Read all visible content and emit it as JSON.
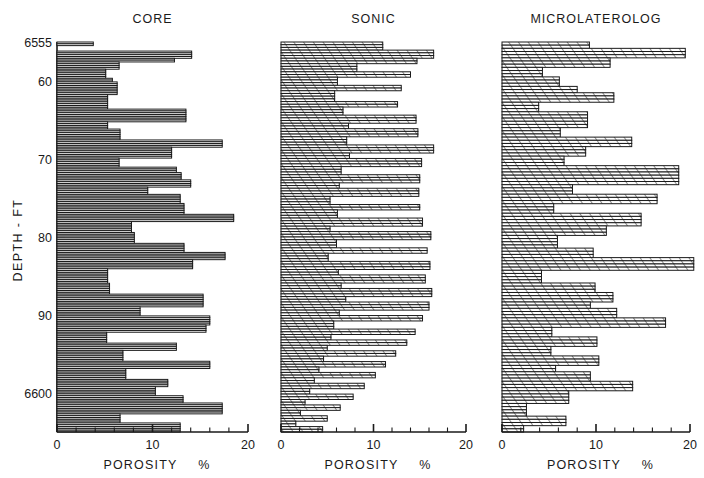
{
  "figure": {
    "ylabel": "DEPTH  -  FT",
    "xlabel": "POROSITY",
    "xunit": "%",
    "panels": [
      "CORE",
      "SONIC",
      "MICROLATEROLOG"
    ]
  },
  "chart_data": {
    "type": "bar",
    "orientation": "horizontal",
    "title": "",
    "xlabel": "POROSITY  %",
    "ylabel": "DEPTH - FT",
    "xlim": [
      0,
      20
    ],
    "ylim": [
      6555,
      6605
    ],
    "xticks": [
      0,
      10,
      20
    ],
    "xtick_labels": [
      "0",
      "10",
      "20"
    ],
    "xminor_step": 2,
    "yticks": [
      6555,
      6560,
      6570,
      6580,
      6590,
      6600
    ],
    "ytick_labels": [
      "6555",
      "60",
      "70",
      "80",
      "90",
      "6600"
    ],
    "grid": false,
    "legend": false,
    "y_inverted": true,
    "series": [
      {
        "name": "CORE",
        "depth_start": 6555.2,
        "step": 0.5,
        "values": [
          3.8,
          3.8,
          0,
          0,
          0,
          14.1,
          14.1,
          14.1,
          14.1,
          12.3,
          12.3,
          6.5,
          6.5,
          6.5,
          6.5,
          5.1,
          5.1,
          5.1,
          5.1,
          5.1,
          5.8,
          5.8,
          6.3,
          6.3,
          6.3,
          6.3,
          6.3,
          6.3,
          6.3,
          5.3,
          5.3,
          5.3,
          5.3,
          5.3,
          5.3,
          5.3,
          5.3,
          13.5,
          13.5,
          13.5,
          13.5,
          13.5,
          13.5,
          13.5,
          5.3,
          5.3,
          5.3,
          5.3,
          6.6,
          6.6,
          6.6,
          6.6,
          6.6,
          6.6,
          17.3,
          17.3,
          17.3,
          17.3,
          12.0,
          12.0,
          12.0,
          12.0,
          12.0,
          12.0,
          6.5,
          6.5,
          6.5,
          6.5,
          6.5,
          12.5,
          12.5,
          12.5,
          13.0,
          13.0,
          13.0,
          13.0,
          14.0,
          14.0,
          14.0,
          14.0,
          9.5,
          9.5,
          9.5,
          9.5,
          12.9,
          12.9,
          12.9,
          12.9,
          12.9,
          13.3,
          13.3,
          13.3,
          13.3,
          13.3,
          13.3,
          18.5,
          18.5,
          18.5,
          18.5,
          7.8,
          7.8,
          7.8,
          7.8,
          7.8,
          7.8,
          8.1,
          8.1,
          8.1,
          8.1,
          8.1,
          8.1,
          13.3,
          13.3,
          13.3,
          13.3,
          13.3,
          17.6,
          17.6,
          17.6,
          17.6,
          14.2,
          14.2,
          14.2,
          14.2,
          14.2,
          5.3,
          5.3,
          5.3,
          5.3,
          5.3,
          5.3,
          5.3,
          5.3,
          5.5,
          5.5,
          5.5,
          5.5,
          5.5,
          5.5,
          15.3,
          15.3,
          15.3,
          15.3,
          15.3,
          15.3,
          15.3,
          8.7,
          8.7,
          8.7,
          8.7,
          8.7,
          16.0,
          16.0,
          16.0,
          16.0,
          16.0,
          15.6,
          15.6,
          15.6,
          15.6,
          5.2,
          5.2,
          5.2,
          5.2,
          5.2,
          5.2,
          12.5,
          12.5,
          12.5,
          12.5,
          6.9,
          6.9,
          6.9,
          6.9,
          6.9,
          6.9,
          16.0,
          16.0,
          16.0,
          16.0,
          7.2,
          7.2,
          7.2,
          7.2,
          7.2,
          7.2,
          11.6,
          11.6,
          11.6,
          11.6,
          10.3,
          10.3,
          10.3,
          10.3,
          10.3,
          13.2,
          13.2,
          13.2,
          13.2,
          17.3,
          17.3,
          17.3,
          17.3,
          17.3,
          17.3,
          6.6,
          6.6,
          6.6,
          6.6,
          6.6,
          12.9,
          12.9,
          12.9,
          12.9,
          12.9
        ]
      },
      {
        "name": "SONIC",
        "depth_start": 6555.2,
        "step": 0.5,
        "values": [
          11.0,
          11.0,
          11.0,
          16.5,
          16.5,
          16.5,
          14.7,
          14.7,
          8.2,
          8.2,
          8.2,
          14.0,
          14.0,
          6.1,
          6.1,
          6.1,
          13.0,
          13.0,
          5.8,
          5.8,
          5.8,
          5.8,
          12.6,
          12.6,
          6.7,
          6.7,
          6.7,
          14.6,
          14.6,
          14.6,
          7.3,
          7.3,
          14.8,
          14.8,
          14.8,
          7.1,
          7.1,
          7.1,
          16.5,
          16.5,
          16.5,
          7.4,
          7.4,
          15.2,
          15.2,
          15.2,
          6.5,
          6.5,
          6.5,
          15.0,
          15.0,
          15.0,
          6.3,
          6.3,
          14.9,
          14.9,
          14.9,
          5.3,
          5.3,
          5.3,
          15.0,
          15.0,
          6.1,
          6.1,
          6.1,
          15.3,
          15.3,
          15.3,
          5.3,
          5.3,
          16.2,
          16.2,
          16.2,
          6.0,
          6.0,
          6.0,
          15.8,
          15.8,
          5.1,
          5.1,
          5.1,
          16.1,
          16.1,
          16.1,
          6.2,
          6.2,
          15.6,
          15.6,
          15.6,
          6.5,
          6.5,
          16.3,
          16.3,
          16.3,
          7.0,
          7.0,
          16.0,
          16.0,
          16.0,
          6.3,
          6.3,
          15.3,
          15.3,
          5.7,
          5.7,
          5.7,
          14.5,
          14.5,
          5.4,
          5.4,
          13.6,
          13.6,
          5.0,
          5.0,
          12.4,
          12.4,
          4.6,
          4.6,
          11.3,
          11.3,
          4.1,
          4.1,
          10.2,
          10.2,
          3.6,
          3.6,
          9.0,
          9.0,
          3.1,
          3.1,
          7.8,
          7.8,
          2.6,
          2.6,
          6.4,
          6.4,
          2.1,
          2.1,
          5.0,
          5.0,
          1.6,
          1.6,
          4.5,
          4.5
        ]
      },
      {
        "name": "MICROLATEROLOG",
        "depth_start": 6555.2,
        "step": 0.5,
        "values": [
          9.3,
          9.3,
          19.5,
          19.5,
          19.5,
          11.5,
          11.5,
          11.5,
          4.3,
          4.3,
          4.3,
          6.1,
          6.1,
          6.1,
          8.0,
          8.0,
          11.9,
          11.9,
          11.9,
          3.9,
          3.9,
          3.9,
          9.1,
          9.1,
          9.1,
          9.1,
          9.1,
          6.2,
          6.2,
          6.2,
          13.8,
          13.8,
          13.8,
          8.9,
          8.9,
          8.9,
          6.6,
          6.6,
          6.6,
          18.8,
          18.8,
          18.8,
          18.8,
          18.8,
          18.8,
          7.5,
          7.5,
          7.5,
          16.5,
          16.5,
          16.5,
          5.5,
          5.5,
          5.5,
          14.8,
          14.8,
          14.8,
          14.8,
          11.1,
          11.1,
          11.1,
          5.9,
          5.9,
          5.9,
          5.9,
          9.7,
          9.7,
          9.7,
          20.4,
          20.4,
          20.4,
          20.4,
          4.2,
          4.2,
          4.2,
          4.2,
          9.9,
          9.9,
          9.9,
          11.8,
          11.8,
          11.8,
          9.4,
          9.4,
          12.2,
          12.2,
          12.2,
          17.4,
          17.4,
          17.4,
          5.3,
          5.3,
          5.3,
          10.1,
          10.1,
          10.1,
          5.2,
          5.2,
          5.2,
          10.3,
          10.3,
          10.3,
          5.7,
          5.7,
          9.4,
          9.4,
          9.4,
          13.9,
          13.9,
          13.9,
          7.1,
          7.1,
          7.1,
          7.1,
          2.6,
          2.6,
          2.6,
          2.6,
          6.8,
          6.8,
          6.8,
          2.3,
          2.3
        ]
      }
    ]
  }
}
